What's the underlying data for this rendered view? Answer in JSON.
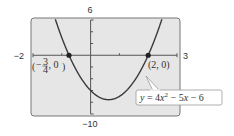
{
  "chart_data": {
    "type": "line",
    "title": "",
    "equation": "y = 4x² − 5x − 6",
    "equation_parts": {
      "lhs": "y",
      "eq": " = 4",
      "x1": "x",
      "sup": "2",
      "mid": " − 5",
      "x2": "x",
      "tail": " − 6"
    },
    "xlabel": "",
    "ylabel": "",
    "xlim": [
      -2,
      3
    ],
    "ylim": [
      -10,
      6
    ],
    "window_labels": {
      "xmin": "−2",
      "xmax": "3",
      "ymin": "−10",
      "ymax": "6"
    },
    "grid": false,
    "x_ticks": [
      -1,
      0,
      1,
      2
    ],
    "y_ticks": [
      -8,
      -6,
      -4,
      -2,
      2,
      4
    ],
    "series": [
      {
        "name": "y = 4x^2 - 5x - 6",
        "function": {
          "a": 4,
          "b": -5,
          "c": -6
        },
        "x": [
          -1.2,
          -1.0,
          -0.75,
          -0.5,
          0,
          0.25,
          0.625,
          1.0,
          1.5,
          2.0,
          2.25,
          2.5
        ],
        "values": [
          5.76,
          3.0,
          0,
          -2.0,
          -6.0,
          -7.0,
          -7.5625,
          -7.0,
          -4.5,
          0,
          2.0,
          4.5
        ]
      }
    ],
    "points": [
      {
        "x": -0.75,
        "y": 0,
        "label_open": "(−",
        "label_num": "3",
        "label_den": "4",
        "label_close": ", 0)"
      },
      {
        "x": 2,
        "y": 0,
        "label": "(2, 0)"
      }
    ],
    "colors": {
      "plot_bg": "#e6e6e6",
      "frame": "#777777",
      "curve": "#3a3a3a",
      "axis": "#555555",
      "point": "#222222",
      "callout_bg": "#ffffff",
      "callout_border": "#999999"
    }
  }
}
